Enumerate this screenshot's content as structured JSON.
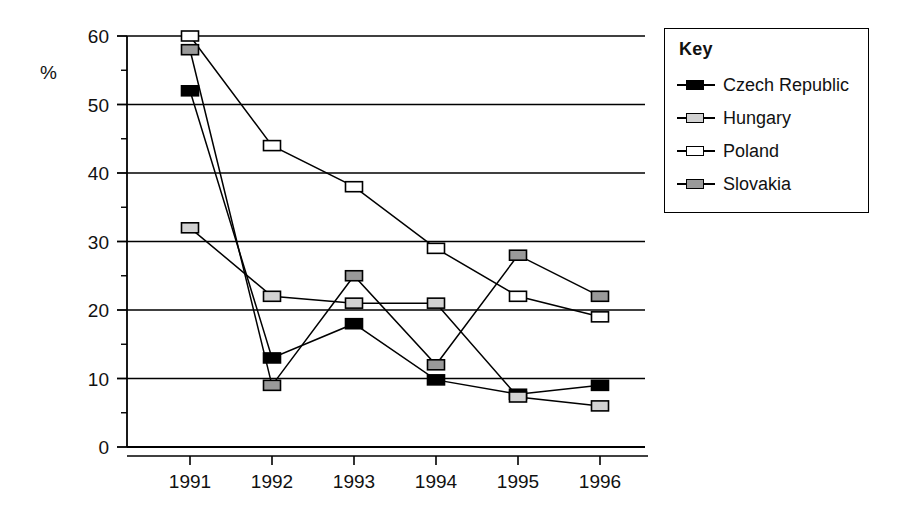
{
  "chart_data": {
    "type": "line",
    "title": "",
    "xlabel": "",
    "ylabel": "%",
    "categories": [
      "1991",
      "1992",
      "1993",
      "1994",
      "1995",
      "1996"
    ],
    "x": [
      1991,
      1992,
      1993,
      1994,
      1995,
      1996
    ],
    "ylim": [
      0,
      60
    ],
    "xlim": [
      1990.4,
      1996.7
    ],
    "y_ticks": [
      0,
      10,
      20,
      30,
      40,
      50,
      60
    ],
    "y_tick_labels": [
      "0",
      "10",
      "20",
      "30",
      "40",
      "50",
      "60"
    ],
    "y_minor_ticks": [
      5,
      15,
      25,
      35,
      45,
      55
    ],
    "grid": "horizontal-major",
    "legend_position": "right-outside",
    "legend_title": "Key",
    "series": [
      {
        "name": "Czech Republic",
        "marker": "square-filled-black",
        "color": "#000000",
        "values": [
          52,
          13,
          18,
          9.8,
          7.7,
          9
        ]
      },
      {
        "name": "Hungary",
        "marker": "square-light-gray",
        "color": "#d2d2d2",
        "values": [
          32,
          22,
          21,
          21,
          7.3,
          6
        ]
      },
      {
        "name": "Poland",
        "marker": "square-hollow-white",
        "color": "#ffffff",
        "values": [
          60,
          44,
          38,
          29,
          22,
          19
        ]
      },
      {
        "name": "Slovakia",
        "marker": "square-medium-gray",
        "color": "#9a9a9a",
        "values": [
          58,
          9,
          25,
          12,
          28,
          22
        ]
      }
    ]
  },
  "legend": {
    "title": "Key",
    "items": [
      {
        "label": "Czech Republic"
      },
      {
        "label": "Hungary"
      },
      {
        "label": "Poland"
      },
      {
        "label": "Slovakia"
      }
    ]
  },
  "axis": {
    "y_unit_label": "%"
  }
}
